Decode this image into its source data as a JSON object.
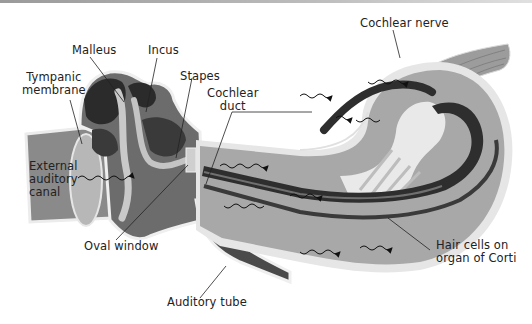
{
  "figure": {
    "labels": {
      "cochlear_nerve": "Cochlear nerve",
      "malleus": "Malleus",
      "incus": "Incus",
      "tympanic_membrane_1": "Tympanic",
      "tympanic_membrane_2": "membrane",
      "stapes": "Stapes",
      "cochlear_duct_1": "Cochlear",
      "cochlear_duct_2": "duct",
      "external_canal_1": "External",
      "external_canal_2": "auditory",
      "external_canal_3": "canal",
      "oval_window": "Oval window",
      "auditory_tube": "Auditory tube",
      "hair_cells_1": "Hair cells on",
      "hair_cells_2": "organ of Corti"
    },
    "colors": {
      "background": "#ffffff",
      "outline": "#e9e9e9",
      "fluid": "#a9a9a9",
      "tissue_dark": "#3c3c3c",
      "bone_dark": "#2a2a2a",
      "canal": "#8a8a8a",
      "leader_line": "#222222",
      "wave": "#111111"
    }
  }
}
